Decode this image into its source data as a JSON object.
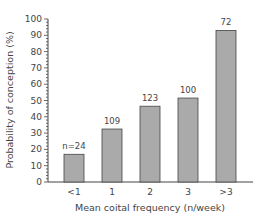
{
  "chart_data": {
    "type": "bar",
    "title": "",
    "xlabel": "Mean coital frequency (n/week)",
    "ylabel": "Probability of conception (%)",
    "ylim": [
      0,
      100
    ],
    "yticks": [
      0,
      10,
      20,
      30,
      40,
      50,
      60,
      70,
      80,
      90,
      100
    ],
    "grid": false,
    "legend": null,
    "categories": [
      "<1",
      "1",
      "2",
      "3",
      ">3"
    ],
    "values": [
      17,
      32.5,
      46.5,
      51.5,
      93
    ],
    "annotations": [
      "n=24",
      "109",
      "123",
      "100",
      "72"
    ],
    "bar_color": "#aaaaaa",
    "bar_edge_color": "#444444"
  }
}
